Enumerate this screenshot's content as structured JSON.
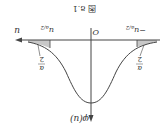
{
  "figure": {
    "caption": "图 8.1",
    "x_axis_label": "u",
    "y_axis_label": "φ(u)",
    "origin_label": "O",
    "left_tick_label": "−u",
    "left_tick_sub": "α/2",
    "right_tick_label": "u",
    "right_tick_sub": "α/2",
    "tail_label_num": "α",
    "tail_label_den": "2",
    "shade_color": "#c8c8c8",
    "line_color": "#444444"
  }
}
